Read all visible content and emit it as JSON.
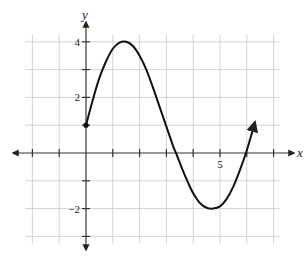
{
  "chart_data": {
    "type": "line",
    "title": "",
    "xlabel": "x",
    "ylabel": "y",
    "xlim": [
      -2.5,
      7.8
    ],
    "ylim": [
      -3.5,
      4.8
    ],
    "grid": true,
    "grid_x": [
      -2,
      -1,
      0,
      1,
      2,
      3,
      4,
      5,
      6,
      7
    ],
    "grid_y": [
      -3,
      -2,
      -1,
      0,
      1,
      2,
      3,
      4
    ],
    "x_ticks": [
      -2,
      -1,
      1,
      2,
      3,
      4,
      5,
      6,
      7
    ],
    "y_ticks": [
      -3,
      -2,
      -1,
      1,
      2,
      3,
      4
    ],
    "x_tick_labels": [
      {
        "value": 5,
        "text": "5"
      }
    ],
    "y_tick_labels": [
      {
        "value": 4,
        "text": "4"
      },
      {
        "value": 2,
        "text": "2"
      },
      {
        "value": -2,
        "text": "-2"
      }
    ],
    "series": [
      {
        "name": "f(x)",
        "start_marker": "closed-dot",
        "end_marker": "arrow",
        "points": [
          [
            0,
            1
          ],
          [
            0.25,
            1.9
          ],
          [
            0.5,
            2.7
          ],
          [
            0.75,
            3.3
          ],
          [
            1.0,
            3.75
          ],
          [
            1.25,
            3.97
          ],
          [
            1.5,
            4.0
          ],
          [
            1.75,
            3.85
          ],
          [
            2.0,
            3.5
          ],
          [
            2.25,
            3.0
          ],
          [
            2.5,
            2.35
          ],
          [
            2.75,
            1.65
          ],
          [
            3.0,
            0.95
          ],
          [
            3.25,
            0.25
          ],
          [
            3.4,
            -0.1
          ],
          [
            3.6,
            -0.6
          ],
          [
            3.8,
            -1.05
          ],
          [
            4.0,
            -1.45
          ],
          [
            4.25,
            -1.8
          ],
          [
            4.5,
            -1.97
          ],
          [
            4.75,
            -2.0
          ],
          [
            5.0,
            -1.92
          ],
          [
            5.25,
            -1.65
          ],
          [
            5.5,
            -1.2
          ],
          [
            5.75,
            -0.6
          ],
          [
            6.0,
            0.1
          ],
          [
            6.2,
            0.75
          ],
          [
            6.3,
            1.1
          ]
        ]
      }
    ]
  }
}
